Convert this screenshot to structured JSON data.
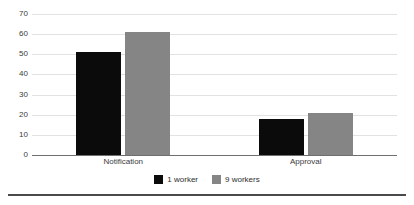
{
  "chart_data": {
    "type": "bar",
    "title": "",
    "subtitle": "",
    "xlabel": "",
    "ylabel": "",
    "categories": [
      "Notification",
      "Approval"
    ],
    "series": [
      {
        "name": "1 worker",
        "values": [
          51,
          18
        ],
        "color": "#0b0b0b"
      },
      {
        "name": "9 workers",
        "values": [
          61,
          21
        ],
        "color": "#858585"
      }
    ],
    "ylim": [
      0,
      70
    ],
    "yticks": [
      0,
      10,
      20,
      30,
      40,
      50,
      60,
      70
    ],
    "ytick_labels": [
      "0",
      "10",
      "20",
      "30",
      "40",
      "50",
      "60",
      "70"
    ],
    "grid": true,
    "grid_axis": "y",
    "legend_position": "bottom-center",
    "bar_group_gap": true
  },
  "axis": {
    "y_ticks": [
      {
        "label": "70",
        "value": 70
      },
      {
        "label": "60",
        "value": 60
      },
      {
        "label": "50",
        "value": 50
      },
      {
        "label": "40",
        "value": 40
      },
      {
        "label": "30",
        "value": 30
      },
      {
        "label": "20",
        "value": 20
      },
      {
        "label": "10",
        "value": 10
      },
      {
        "label": "0",
        "value": 0
      }
    ]
  },
  "legend": {
    "entries": [
      {
        "label": "1 worker",
        "color": "#0b0b0b"
      },
      {
        "label": "9 workers",
        "color": "#858585"
      }
    ]
  },
  "colors": {
    "series_1_worker": "#0b0b0b",
    "series_9_workers": "#858585",
    "gridline": "#e2e2e2",
    "axis": "#6f6f6f",
    "text": "#3b3b3b",
    "rule": "#4a4a4a",
    "background": "#ffffff"
  }
}
